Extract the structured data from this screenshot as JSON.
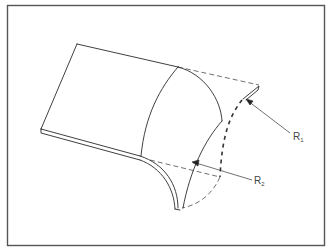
{
  "figure": {
    "type": "technical-line-drawing",
    "colors": {
      "line": "#2a2a2a",
      "frame": "#555555",
      "background": "#ffffff"
    },
    "labels": [
      {
        "id": "r1",
        "base": "R",
        "sub": "1"
      },
      {
        "id": "r2",
        "base": "R",
        "sub": "2"
      }
    ]
  }
}
